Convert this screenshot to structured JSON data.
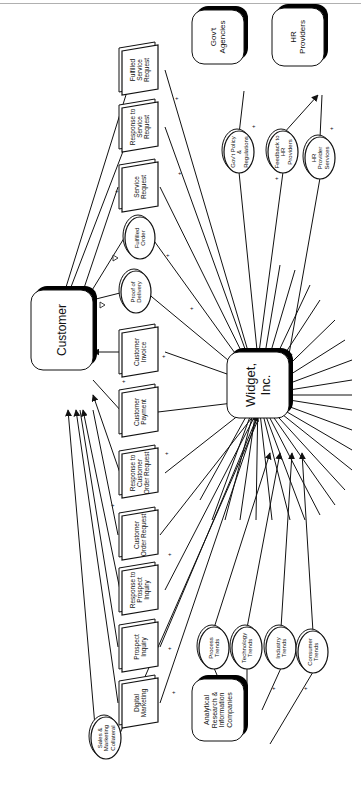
{
  "diagram": {
    "rotation": -90,
    "colors": {
      "stroke": "#111111",
      "shadow": "#000000",
      "fill": "#ffffff",
      "topline": "#b0b0b0"
    }
  },
  "entities": [
    {
      "id": "customer",
      "lines": [
        "Customer"
      ],
      "x": 62,
      "y": 330,
      "w": 62,
      "h": 80,
      "fs": 12
    },
    {
      "id": "widget",
      "lines": [
        "Widget,",
        "Inc."
      ],
      "x": 258,
      "y": 385,
      "w": 62,
      "h": 66,
      "fs": 13
    },
    {
      "id": "govt",
      "lines": [
        "Gov't",
        "Agencies"
      ],
      "x": 218,
      "y": 37,
      "w": 52,
      "h": 54,
      "fs": 8
    },
    {
      "id": "hr",
      "lines": [
        "HR",
        "Providers"
      ],
      "x": 298,
      "y": 37,
      "w": 52,
      "h": 58,
      "fs": 8
    },
    {
      "id": "analytical",
      "lines": [
        "Analytical",
        "Research &",
        "Information",
        "Companies"
      ],
      "x": 218,
      "y": 710,
      "w": 52,
      "h": 62,
      "fs": 7
    }
  ],
  "documents": [
    {
      "id": "fulfilled-service-request",
      "lines": [
        "Fulfilled",
        "Service",
        "Request"
      ],
      "cx": 140,
      "cy": 70
    },
    {
      "id": "response-service-request",
      "lines": [
        "Response to",
        "Service",
        "Request"
      ],
      "cx": 140,
      "cy": 127
    },
    {
      "id": "service-request",
      "lines": [
        "Service",
        "Request"
      ],
      "cx": 140,
      "cy": 187
    },
    {
      "id": "customer-invoice",
      "lines": [
        "Customer",
        "Invoice"
      ],
      "cx": 140,
      "cy": 352
    },
    {
      "id": "customer-payment",
      "lines": [
        "Customer",
        "Payment"
      ],
      "cx": 140,
      "cy": 412
    },
    {
      "id": "response-customer-order",
      "lines": [
        "Response to",
        "Customer",
        "Order Request"
      ],
      "cx": 140,
      "cy": 473
    },
    {
      "id": "customer-order-request",
      "lines": [
        "Customer",
        "Order Request"
      ],
      "cx": 140,
      "cy": 535
    },
    {
      "id": "response-prospect-inquiry",
      "lines": [
        "Response to",
        "Prospect",
        "Inquiry"
      ],
      "cx": 140,
      "cy": 590
    },
    {
      "id": "prospect-inquiry",
      "lines": [
        "Prospect",
        "Inquiry"
      ],
      "cx": 140,
      "cy": 647
    },
    {
      "id": "digital-marketing",
      "lines": [
        "Digital",
        "Marketing"
      ],
      "cx": 140,
      "cy": 703
    }
  ],
  "ovals": [
    {
      "id": "fulfilled-order",
      "lines": [
        "Fulfilled",
        "Order"
      ],
      "cx": 140,
      "cy": 238
    },
    {
      "id": "proof-of-delivery",
      "lines": [
        "Proof of",
        "Delivery"
      ],
      "cx": 136,
      "cy": 292
    },
    {
      "id": "sales-marketing-collateral",
      "lines": [
        "Sales &",
        "Marketing",
        "Collateral"
      ],
      "cx": 106,
      "cy": 738
    },
    {
      "id": "govt-policy",
      "lines": [
        "Gov't Policy",
        "&",
        "Regulations"
      ],
      "cx": 239,
      "cy": 152
    },
    {
      "id": "feedback-hr",
      "lines": [
        "Feedback to",
        "HR",
        "Providers"
      ],
      "cx": 283,
      "cy": 152
    },
    {
      "id": "hr-provider-services",
      "lines": [
        "HR",
        "Provider",
        "Services"
      ],
      "cx": 320,
      "cy": 158
    },
    {
      "id": "process-trends",
      "lines": [
        "Process",
        "Trends"
      ],
      "cx": 214,
      "cy": 648
    },
    {
      "id": "technology-trends",
      "lines": [
        "Technology",
        "Trends"
      ],
      "cx": 247,
      "cy": 648
    },
    {
      "id": "industry-trends",
      "lines": [
        "Industry",
        "Trends"
      ],
      "cx": 281,
      "cy": 648
    },
    {
      "id": "consumer-trends",
      "lines": [
        "Consumer",
        "Trends"
      ],
      "cx": 313,
      "cy": 652
    }
  ],
  "flows": [
    {
      "from": [
        258,
        385
      ],
      "to": [
        165,
        70
      ],
      "arrow": false,
      "plus": [
        175,
        100
      ]
    },
    {
      "from": [
        140,
        50
      ],
      "to": [
        62,
        300
      ],
      "arrow": true
    },
    {
      "from": [
        258,
        385
      ],
      "to": [
        165,
        127
      ],
      "arrow": false,
      "plus": [
        178,
        175
      ]
    },
    {
      "from": [
        140,
        107
      ],
      "to": [
        66,
        300
      ],
      "arrow": true
    },
    {
      "from": [
        80,
        300
      ],
      "to": [
        118,
        187
      ],
      "arrow": false,
      "plus": [
        115,
        193
      ]
    },
    {
      "from": [
        160,
        187
      ],
      "to": [
        258,
        385
      ],
      "arrow": true
    },
    {
      "from": [
        258,
        385
      ],
      "to": [
        152,
        238
      ],
      "arrow": false,
      "plus": [
        166,
        257
      ]
    },
    {
      "from": [
        126,
        235
      ],
      "to": [
        86,
        300
      ],
      "arrow": false
    },
    {
      "from": [
        258,
        385
      ],
      "to": [
        146,
        292
      ],
      "arrow": false,
      "plus": [
        190,
        310
      ]
    },
    {
      "from": [
        124,
        292
      ],
      "to": [
        92,
        300
      ],
      "arrow": false
    },
    {
      "from": [
        258,
        385
      ],
      "to": [
        165,
        352
      ],
      "arrow": false,
      "plus": [
        162,
        358
      ]
    },
    {
      "from": [
        120,
        352
      ],
      "to": [
        93,
        352
      ],
      "arrow": true
    },
    {
      "from": [
        93,
        380
      ],
      "to": [
        122,
        412
      ],
      "arrow": false,
      "plus": [
        122,
        383
      ]
    },
    {
      "from": [
        158,
        412
      ],
      "to": [
        258,
        400
      ],
      "arrow": true
    },
    {
      "from": [
        258,
        400
      ],
      "to": [
        165,
        473
      ],
      "arrow": false,
      "plus": [
        165,
        455
      ]
    },
    {
      "from": [
        120,
        473
      ],
      "to": [
        93,
        395
      ],
      "arrow": true
    },
    {
      "from": [
        93,
        410
      ],
      "to": [
        118,
        535
      ],
      "arrow": false,
      "plus": [
        111,
        507
      ]
    },
    {
      "from": [
        160,
        535
      ],
      "to": [
        258,
        410
      ],
      "arrow": true
    },
    {
      "from": [
        258,
        410
      ],
      "to": [
        165,
        590
      ],
      "arrow": false,
      "plus": [
        168,
        556
      ]
    },
    {
      "from": [
        120,
        590
      ],
      "to": [
        83,
        410
      ],
      "arrow": true
    },
    {
      "from": [
        80,
        410
      ],
      "to": [
        118,
        647
      ],
      "arrow": false,
      "plus": [
        120,
        640
      ]
    },
    {
      "from": [
        160,
        647
      ],
      "to": [
        258,
        415
      ],
      "arrow": true
    },
    {
      "from": [
        258,
        415
      ],
      "to": [
        160,
        703
      ],
      "arrow": false,
      "plus": [
        168,
        650
      ]
    },
    {
      "from": [
        118,
        703
      ],
      "to": [
        76,
        410
      ],
      "arrow": true
    },
    {
      "from": [
        258,
        420
      ],
      "to": [
        118,
        738
      ],
      "arrow": false,
      "plus": [
        172,
        694
      ]
    },
    {
      "from": [
        96,
        738
      ],
      "to": [
        68,
        410
      ],
      "arrow": true
    }
  ],
  "side_flows": [
    {
      "from": [
        244,
        91
      ],
      "to": [
        239,
        134
      ],
      "plus": [
        252,
        128
      ]
    },
    {
      "from": [
        239,
        172
      ],
      "to": [
        258,
        360
      ],
      "arrow": true
    },
    {
      "from": [
        258,
        360
      ],
      "to": [
        283,
        172
      ],
      "plus": [
        275,
        180
      ]
    },
    {
      "from": [
        283,
        134
      ],
      "to": [
        318,
        95
      ],
      "arrow": true
    },
    {
      "from": [
        322,
        95
      ],
      "to": [
        320,
        138
      ],
      "plus": [
        330,
        130
      ]
    },
    {
      "from": [
        320,
        178
      ],
      "to": [
        288,
        360
      ],
      "arrow": true
    },
    {
      "from": [
        232,
        710
      ],
      "to": [
        214,
        668
      ],
      "plus": [
        208,
        690
      ]
    },
    {
      "from": [
        214,
        628
      ],
      "to": [
        270,
        453
      ],
      "arrow": true
    },
    {
      "from": [
        247,
        710
      ],
      "to": [
        247,
        668
      ],
      "plus": [
        241,
        690
      ]
    },
    {
      "from": [
        247,
        628
      ],
      "to": [
        280,
        453
      ],
      "arrow": true
    },
    {
      "from": [
        262,
        710
      ],
      "to": [
        281,
        668
      ],
      "plus": [
        272,
        690
      ]
    },
    {
      "from": [
        281,
        628
      ],
      "to": [
        292,
        453
      ],
      "arrow": true
    },
    {
      "from": [
        270,
        744
      ],
      "to": [
        313,
        672
      ],
      "plus": [
        304,
        690
      ]
    },
    {
      "from": [
        313,
        632
      ],
      "to": [
        302,
        453
      ],
      "arrow": true
    }
  ],
  "radial_stubs": [
    [
      200,
      500
    ],
    [
      212,
      520
    ],
    [
      225,
      520
    ],
    [
      240,
      520
    ],
    [
      256,
      520
    ],
    [
      272,
      520
    ],
    [
      290,
      520
    ],
    [
      305,
      520
    ],
    [
      320,
      515
    ],
    [
      335,
      505
    ],
    [
      345,
      490
    ],
    [
      352,
      470
    ],
    [
      352,
      450
    ],
    [
      352,
      430
    ],
    [
      352,
      410
    ],
    [
      352,
      395
    ],
    [
      352,
      380
    ],
    [
      352,
      360
    ],
    [
      345,
      340
    ],
    [
      335,
      320
    ],
    [
      320,
      300
    ],
    [
      310,
      285
    ],
    [
      295,
      270
    ],
    [
      280,
      265
    ]
  ],
  "markers": {
    "delta_1": {
      "x": 105,
      "y": 305
    },
    "delta_2": {
      "x": 118,
      "y": 258
    }
  }
}
